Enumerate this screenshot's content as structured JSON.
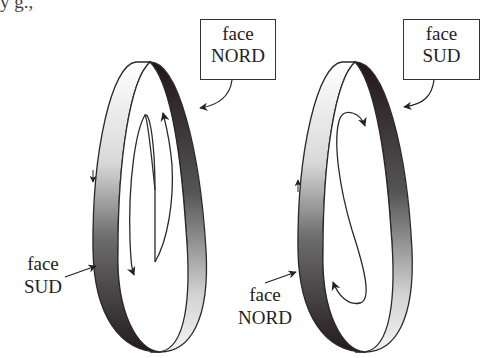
{
  "caption_fragment": "y g.,",
  "diagram": {
    "left_ring": {
      "box_label": {
        "line1": "face",
        "line2": "NORD"
      },
      "side_label": {
        "line1": "face",
        "line2": "SUD"
      },
      "inner_arrows": "two vertical arrows: up on right, down on left (opposite directions)",
      "rim_arrow": "down on outer left rim"
    },
    "right_ring": {
      "box_label": {
        "line1": "face",
        "line2": "SUD"
      },
      "side_label": {
        "line1": "face",
        "line2": "NORD"
      },
      "inner_arrows": "S-shaped curve with arrowheads at both ends",
      "rim_arrow": "up on outer left rim"
    },
    "colors": {
      "stroke": "#2a2a2a",
      "dark_face": "#2b1f22",
      "light_face": "#f2f2f2",
      "mid_gray": "#8a8a8a"
    }
  }
}
